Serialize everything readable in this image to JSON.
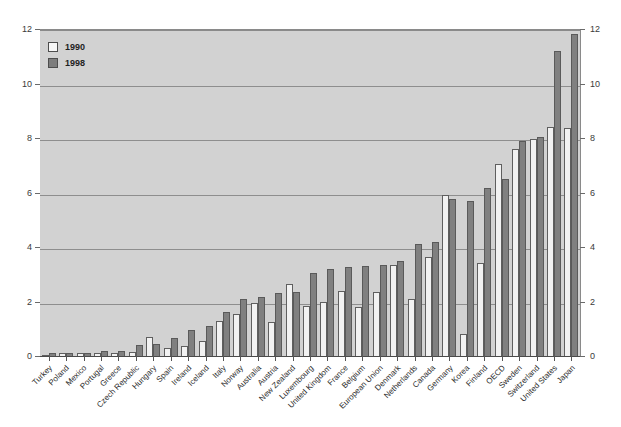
{
  "chart_data": {
    "type": "bar",
    "title": "",
    "subtitle": "",
    "xlabel": "",
    "ylabel": "",
    "ylim": [
      0,
      12
    ],
    "ytick_values": [
      0,
      2,
      4,
      6,
      8,
      10,
      12
    ],
    "ytick_labels": [
      "0",
      "2",
      "4",
      "6",
      "8",
      "10",
      "12"
    ],
    "grid": true,
    "grid_axis": "y",
    "legend_position": "top-left",
    "dual_y_axis": true,
    "categories": [
      "Turkey",
      "Poland",
      "Mexico",
      "Portugal",
      "Greece",
      "Czech Republic",
      "Hungary",
      "Spain",
      "Ireland",
      "Iceland",
      "Italy",
      "Norway",
      "Australia",
      "Austria",
      "New Zealand",
      "Luxembourg",
      "United Kingdom",
      "France",
      "Belgium",
      "European Union",
      "Denmark",
      "Netherlands",
      "Canada",
      "Germany",
      "Korea",
      "Finland",
      "OECD",
      "Sweden",
      "Switzerland",
      "United States",
      "Japan"
    ],
    "series": [
      {
        "name": "1990",
        "color": "#f2f2f2",
        "values": [
          0.05,
          0.1,
          0.1,
          0.12,
          0.12,
          0.15,
          0.7,
          0.3,
          0.35,
          0.55,
          1.3,
          1.55,
          1.95,
          1.25,
          2.65,
          1.85,
          2.0,
          2.4,
          1.8,
          2.35,
          3.35,
          2.1,
          3.65,
          5.9,
          0.8,
          3.4,
          7.05,
          7.6,
          7.95,
          8.4,
          8.35
        ]
      },
      {
        "name": "1998",
        "color": "#808080",
        "values": [
          0.1,
          0.1,
          0.12,
          0.18,
          0.2,
          0.4,
          0.45,
          0.65,
          0.95,
          1.1,
          1.6,
          2.1,
          2.15,
          2.3,
          2.35,
          3.05,
          3.2,
          3.25,
          3.3,
          3.35,
          3.5,
          4.1,
          4.2,
          5.75,
          5.7,
          6.15,
          6.5,
          7.9,
          8.05,
          11.2,
          11.8
        ]
      }
    ]
  },
  "legend": {
    "items": [
      {
        "label": "1990",
        "swatch": "white-square-swatch"
      },
      {
        "label": "1998",
        "swatch": "gray-square-swatch"
      }
    ]
  },
  "colors": {
    "plot_background": "#d2d2d2",
    "figure_background": "#ffffff",
    "series_1990": "#f2f2f2",
    "series_1998": "#808080",
    "gridline": "#8e8e8e",
    "axis": "#4a4a4a",
    "text": "#2b2b2b"
  }
}
